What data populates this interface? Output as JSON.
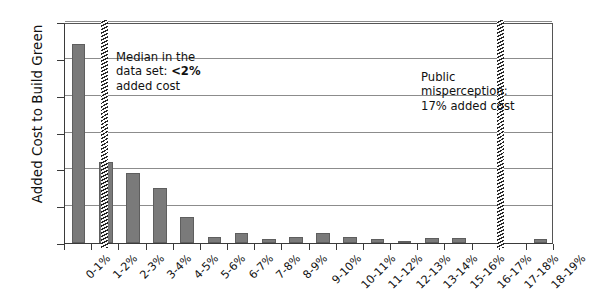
{
  "chart_data": {
    "type": "bar",
    "title": "",
    "xlabel": "",
    "ylabel": "Added Cost to Build Green",
    "ylim": [
      0,
      60
    ],
    "yticks": [
      0,
      10,
      20,
      30,
      40,
      50,
      60
    ],
    "grid": true,
    "legend": "none",
    "bar_color": "#7a7a7a",
    "categories": [
      "0-1%",
      "1-2%",
      "2-3%",
      "3-4%",
      "4-5%",
      "5-6%",
      "6-7%",
      "7-8%",
      "8-9%",
      "9-10%",
      "10-11%",
      "11-12%",
      "12-13%",
      "13-14%",
      "15-16%",
      "16-17%",
      "17-18%",
      "18-19%"
    ],
    "values": [
      54,
      22,
      19,
      15,
      7,
      1.5,
      2.8,
      1,
      1.5,
      2.6,
      1.5,
      1,
      0.6,
      1.4,
      1.4,
      0,
      0,
      1
    ],
    "annotations": [
      {
        "name": "median-annotation",
        "line1": "Median in the",
        "line2_prefix": "data set: ",
        "line2_bold": "<2%",
        "line3": "added cost",
        "marker_value": "2%"
      },
      {
        "name": "misperception-annotation",
        "line1": "Public",
        "line2": "misperception:",
        "line3": "17% added cost",
        "marker_value": "17%"
      }
    ]
  },
  "y_axis": {
    "title": "Added Cost to Build Green",
    "ticks": [
      "0",
      "10",
      "20",
      "30",
      "40",
      "50",
      "60"
    ]
  }
}
